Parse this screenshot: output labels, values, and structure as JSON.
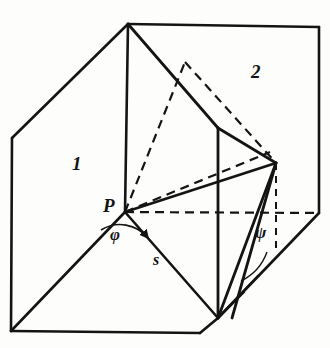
{
  "figure": {
    "background_color": "#fdfdfc",
    "ink_color": "#141414",
    "labels": [
      {
        "id": "region-1",
        "text": "1",
        "x": 72,
        "y": 162,
        "kind": "region"
      },
      {
        "id": "region-2",
        "text": "2",
        "x": 251,
        "y": 70,
        "kind": "region"
      },
      {
        "id": "point-p",
        "text": "P",
        "x": 103,
        "y": 203,
        "kind": "point"
      },
      {
        "id": "angle-phi",
        "text": "φ",
        "x": 110,
        "y": 234,
        "kind": "angle"
      },
      {
        "id": "angle-psi",
        "text": "ψ",
        "x": 255,
        "y": 232,
        "kind": "angle"
      },
      {
        "id": "segment-s",
        "text": "s",
        "x": 153,
        "y": 259,
        "kind": "segment"
      }
    ],
    "geometry": {
      "vertices": {
        "top_front": [
          128,
          24
        ],
        "top_back": [
          319,
          27
        ],
        "left_upper": [
          12,
          138
        ],
        "left_lower": [
          11,
          331
        ],
        "bottom_left": [
          200,
          333
        ],
        "bottom_front": [
          218,
          318
        ],
        "right_mid": [
          319,
          213
        ],
        "mid_front": [
          125,
          212
        ],
        "inner_right": [
          276,
          163
        ],
        "inner_top": [
          185,
          62
        ],
        "face_right": [
          218,
          128
        ],
        "cut_right": [
          270,
          152
        ]
      },
      "solid_paths": [
        "M128,24 L319,27",
        "M128,24 L12,138",
        "M12,138 L11,331",
        "M11,331 L200,333",
        "M200,333 L218,318",
        "M319,27 L319,213",
        "M319,213 L218,318",
        "M128,24 L125,212",
        "M125,212 L11,331",
        "M125,212 L218,318",
        "M128,24 L218,128",
        "M218,128 L218,318",
        "M218,128 L276,163",
        "M276,163 L218,318",
        "M125,212 L276,163",
        "M232,318 L276,163"
      ],
      "dashed_paths": [
        "M125,212 L319,213",
        "M125,212 L185,62",
        "M185,62 L276,163",
        "M125,212 L270,152",
        "M276,163 L276,245"
      ],
      "arcs": [
        {
          "id": "arc-phi",
          "path": "M101,228 A34,34 0 0 1 146,236",
          "arrow": true
        },
        {
          "id": "arc-psi",
          "path": "M244,276 A46,46 0 0 0 268,255",
          "arrow": false
        }
      ]
    }
  }
}
